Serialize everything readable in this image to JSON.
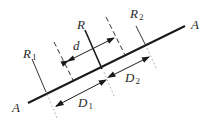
{
  "diagram": {
    "type": "geometry",
    "labels": {
      "a_left": "A",
      "a_right": "A",
      "r1_main": "R",
      "r1_sub": "1",
      "r_main": "R",
      "r2_main": "R",
      "r2_sub": "2",
      "d": "d",
      "d1_main": "D",
      "d1_sub": "1",
      "d2_main": "D",
      "d2_sub": "2"
    },
    "colors": {
      "line": "#1a1a1a",
      "thin": "#333333",
      "dashed": "#555555"
    }
  }
}
